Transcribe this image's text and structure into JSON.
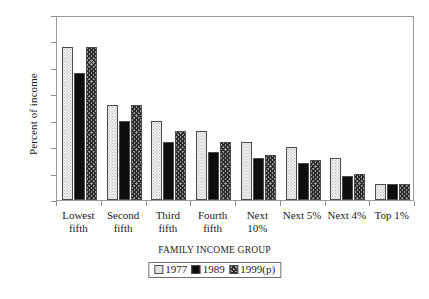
{
  "chart_data": {
    "type": "bar",
    "title": "",
    "xlabel": "FAMILY INCOME GROUP",
    "ylabel": "Percent of income",
    "ylim": [
      0,
      3.5
    ],
    "yticks": [
      "0",
      "0.5",
      "1",
      "1.5",
      "2",
      "2.5",
      "3",
      "3.5"
    ],
    "grid": false,
    "legend_position": "bottom-center",
    "categories": [
      "Lowest\nfifth",
      "Second\nfifth",
      "Third\nfifth",
      "Fourth\nfifth",
      "Next\n10%",
      "Next 5%",
      "Next 4%",
      "Top 1%"
    ],
    "series": [
      {
        "name": "1977",
        "fill": "light-dotted",
        "color": "#f0f0ee",
        "values": [
          2.9,
          1.8,
          1.5,
          1.3,
          1.1,
          1.0,
          0.8,
          0.3
        ]
      },
      {
        "name": "1989",
        "fill": "solid-black",
        "color": "#0d0d0d",
        "values": [
          2.4,
          1.5,
          1.1,
          0.9,
          0.8,
          0.7,
          0.45,
          0.3
        ]
      },
      {
        "name": "1999(p)",
        "fill": "cross-hatched",
        "color": "#9c9c9c",
        "values": [
          2.9,
          1.8,
          1.3,
          1.1,
          0.85,
          0.75,
          0.5,
          0.3
        ]
      }
    ]
  }
}
